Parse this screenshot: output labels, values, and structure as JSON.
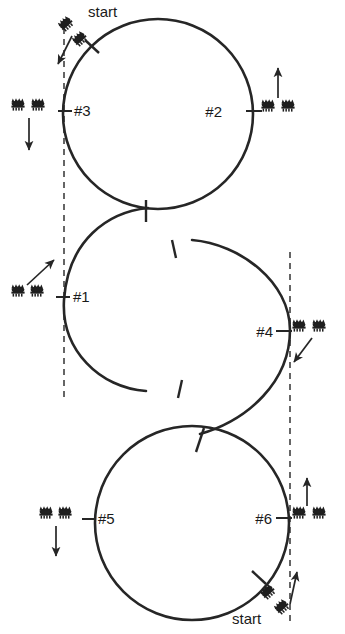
{
  "diagram": {
    "type": "driving-course-layout",
    "colors": {
      "path": "#262626",
      "dashed_guide": "#333333",
      "text": "#1a1a1a",
      "cone": "#1f1f1f",
      "background": "#ffffff"
    },
    "start_labels": [
      {
        "id": "start-top",
        "text": "start",
        "x": 88,
        "y": 16
      },
      {
        "id": "start-bottom",
        "text": "start",
        "x": 232,
        "y": 619
      }
    ],
    "stations": [
      {
        "id": "station-1",
        "label": "#1",
        "label_x": 73,
        "label_y": 302,
        "tick_x": 56,
        "tick_y": 297,
        "cones": [
          {
            "x": 18,
            "y": 291,
            "rotation": 0
          },
          {
            "x": 36,
            "y": 291,
            "rotation": 0
          }
        ],
        "arrow": {
          "direction": "up-right",
          "x1": 28,
          "y1": 288,
          "x2": 55,
          "y2": 262
        }
      },
      {
        "id": "station-2",
        "label": "#2",
        "label_x": 222,
        "label_y": 117,
        "tick_x": 252,
        "tick_y": 111,
        "cones": [
          {
            "x": 268,
            "y": 106,
            "rotation": 0
          },
          {
            "x": 288,
            "y": 106,
            "rotation": 0
          }
        ],
        "arrow": {
          "direction": "up",
          "x1": 278,
          "y1": 100,
          "x2": 278,
          "y2": 70
        }
      },
      {
        "id": "station-3",
        "label": "#3",
        "label_x": 74,
        "label_y": 116,
        "tick_x": 58,
        "tick_y": 111,
        "cones": [
          {
            "x": 18,
            "y": 105,
            "rotation": 0
          },
          {
            "x": 38,
            "y": 105,
            "rotation": 0
          }
        ],
        "arrow": {
          "direction": "down",
          "x1": 29,
          "y1": 118,
          "x2": 29,
          "y2": 150
        }
      },
      {
        "id": "station-4",
        "label": "#4",
        "label_x": 251,
        "label_y": 337,
        "tick_x": 281,
        "tick_y": 331,
        "cones": [
          {
            "x": 297,
            "y": 326,
            "rotation": 0
          },
          {
            "x": 316,
            "y": 326,
            "rotation": 0
          }
        ],
        "arrow": {
          "direction": "down-right",
          "x1": 302,
          "y1": 337,
          "x2": 288,
          "y2": 358
        }
      },
      {
        "id": "station-5",
        "label": "#5",
        "label_x": 98,
        "label_y": 524,
        "tick_x": 82,
        "tick_y": 519,
        "cones": [
          {
            "x": 46,
            "y": 513,
            "rotation": 0
          },
          {
            "x": 64,
            "y": 513,
            "rotation": 0
          }
        ],
        "arrow": {
          "direction": "down",
          "x1": 56,
          "y1": 525,
          "x2": 56,
          "y2": 555
        }
      },
      {
        "id": "station-6",
        "label": "#6",
        "label_x": 250,
        "label_y": 524,
        "tick_x": 282,
        "tick_y": 518,
        "cones": [
          {
            "x": 297,
            "y": 513,
            "rotation": 0
          },
          {
            "x": 317,
            "y": 513,
            "rotation": 0
          }
        ],
        "arrow": {
          "direction": "up",
          "x1": 307,
          "y1": 508,
          "x2": 307,
          "y2": 480
        }
      }
    ],
    "start_markers": [
      {
        "id": "start-marker-top",
        "cones": [
          {
            "x": 62,
            "y": 20,
            "rotation": -42
          },
          {
            "x": 74,
            "y": 32,
            "rotation": -42
          }
        ],
        "arrow": {
          "x1": 72,
          "y1": 32,
          "x2": 57,
          "y2": 62
        },
        "cross_tick": {
          "cx": 92,
          "cy": 47,
          "angle": -40
        }
      },
      {
        "id": "start-marker-bottom",
        "cones": [
          {
            "x": 265,
            "y": 588,
            "rotation": -42
          },
          {
            "x": 277,
            "y": 600,
            "rotation": -42
          }
        ],
        "arrow": {
          "x1": 285,
          "y1": 602,
          "x2": 295,
          "y2": 568
        },
        "cross_tick": {
          "cx": 258,
          "cy": 578,
          "angle": -40
        }
      }
    ],
    "guides": [
      {
        "id": "dashed-left",
        "x": 64,
        "y1": 28,
        "y2": 398
      },
      {
        "id": "dashed-right",
        "x": 290,
        "y1": 252,
        "y2": 622
      }
    ],
    "circles": [
      {
        "id": "circle-top",
        "cx": 158,
        "cy": 114,
        "r": 95
      },
      {
        "id": "circle-bottom",
        "cx": 192,
        "cy": 523,
        "r": 97
      }
    ],
    "arcs": [
      {
        "id": "arc-middle-left",
        "description": "left C arc of S-curve"
      },
      {
        "id": "arc-middle-right",
        "description": "right reverse arc of S-curve"
      }
    ]
  }
}
